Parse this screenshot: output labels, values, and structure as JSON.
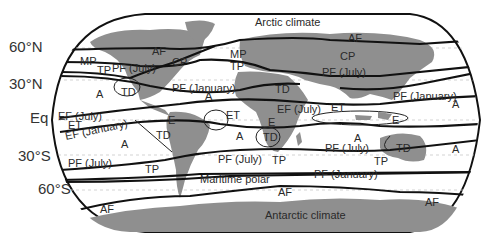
{
  "map": {
    "title": "Global air masses and frontal zones",
    "latitude_labels": [
      "60°N",
      "30°N",
      "Eq",
      "30°S",
      "60°S"
    ],
    "climate_labels": {
      "arctic": "Arctic climate",
      "antarctic": "Antarctic climate",
      "maritime_polar": "Maritime polar"
    },
    "region_labels": {
      "af_nw": "AF",
      "af_ne": "AF",
      "af_sw": "AF",
      "af_s": "AF",
      "af_se": "AF",
      "mp_w": "MP",
      "mp_mid": "MP",
      "cp_na": "CP",
      "cp_asia": "CP",
      "tp_w": "TP",
      "tp_mid": "TP",
      "tp_sw": "TP",
      "tp_s": "TP",
      "tp_se": "TP",
      "pf_july_na": "PF (July)",
      "pf_july_asia": "PF (July)",
      "pf_january_atl": "PF (January)",
      "pf_january_pac": "PF (January)",
      "pf_july_sw": "PF (July)",
      "pf_july_s": "PF (July)",
      "pf_july_se": "PF (July)",
      "pf_january_s": "PF (January)",
      "td_na": "TD",
      "td_sahara": "TD",
      "td_sa": "TD",
      "td_safrica": "TD",
      "td_aus": "TD",
      "a_npac": "A",
      "a_natl": "A",
      "a_wpac": "A",
      "a_spac": "A",
      "a_satl": "A",
      "a_sind": "A",
      "a_eaus": "A",
      "ef_july_w": "EF (July)",
      "ef_july_afr": "EF (July)",
      "ef_january_w": "EF (January)",
      "et_w": "ET",
      "et_atl": "ET",
      "et_ind": "ET",
      "e_sa": "E",
      "e_afr": "E",
      "e_indo": "E"
    }
  }
}
